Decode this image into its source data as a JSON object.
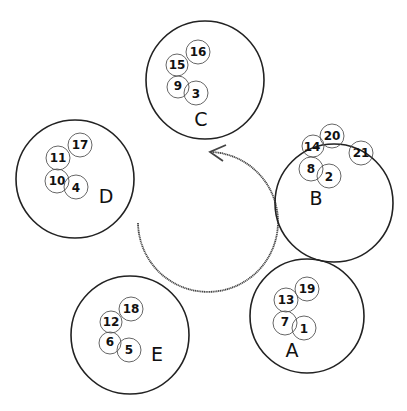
{
  "diagram": {
    "rotation_direction": "counter-clockwise",
    "groups": [
      {
        "label": "C",
        "items": [
          "16",
          "15",
          "9",
          "3"
        ]
      },
      {
        "label": "B",
        "items": [
          "20",
          "14",
          "21",
          "8",
          "2"
        ]
      },
      {
        "label": "D",
        "items": [
          "17",
          "11",
          "10",
          "4"
        ]
      },
      {
        "label": "E",
        "items": [
          "18",
          "12",
          "6",
          "5"
        ]
      },
      {
        "label": "A",
        "items": [
          "19",
          "13",
          "7",
          "1"
        ]
      }
    ]
  }
}
